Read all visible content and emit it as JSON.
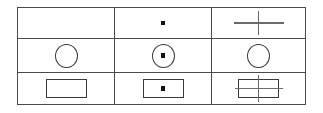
{
  "figure": {
    "type": "matrix-reasoning-puzzle",
    "rows": 3,
    "columns": 3,
    "border_color": "#4a4a4a",
    "shape_color": "#3a3a3a",
    "dot_color": "#111111",
    "line_color": "#6b6b6b",
    "background_color": "#ffffff"
  },
  "cells": [
    {
      "id": "r1c1",
      "row": 1,
      "column": 1,
      "contents": [],
      "description": "empty cell"
    },
    {
      "id": "r1c2",
      "row": 1,
      "column": 2,
      "contents": [
        "dot"
      ],
      "description": "small filled square dot, centered"
    },
    {
      "id": "r1c3",
      "row": 1,
      "column": 3,
      "contents": [
        "cross"
      ],
      "description": "plus sign / cross, centered"
    },
    {
      "id": "r2c1",
      "row": 2,
      "column": 1,
      "contents": [
        "circle"
      ],
      "description": "empty circle outline, centered"
    },
    {
      "id": "r2c2",
      "row": 2,
      "column": 2,
      "contents": [
        "circle",
        "dot"
      ],
      "description": "circle outline containing a centered dot"
    },
    {
      "id": "r2c3",
      "row": 2,
      "column": 3,
      "contents": [
        "circle"
      ],
      "description": "empty circle outline, centered"
    },
    {
      "id": "r3c1",
      "row": 3,
      "column": 1,
      "contents": [
        "rectangle"
      ],
      "description": "empty rectangle outline, centered"
    },
    {
      "id": "r3c2",
      "row": 3,
      "column": 2,
      "contents": [
        "rectangle",
        "dot"
      ],
      "description": "rectangle outline containing a centered dot"
    },
    {
      "id": "r3c3",
      "row": 3,
      "column": 3,
      "contents": [
        "rectangle",
        "cross"
      ],
      "description": "rectangle outline overlaid with a cross extending past its edges"
    }
  ]
}
